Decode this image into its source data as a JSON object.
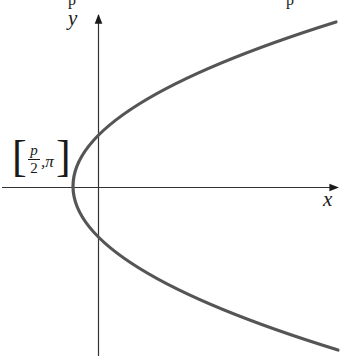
{
  "diagram": {
    "type": "parametric-curve-plot",
    "axes": {
      "x_label": "x",
      "y_label": "y",
      "color": "#333333"
    },
    "curve": {
      "shape": "parabola opening rightward",
      "color": "#555555",
      "vertex_on_negative_x_axis": true
    },
    "point_label": {
      "bracket_open": "[",
      "numerator": "p",
      "denominator": "2",
      "separator": ",",
      "second": "π",
      "bracket_close": "]"
    },
    "clipped_top_text": [
      "p",
      "p"
    ]
  }
}
